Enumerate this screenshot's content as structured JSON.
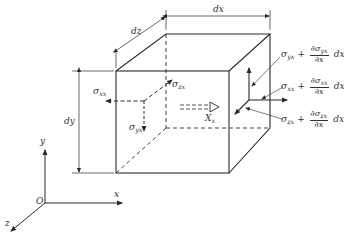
{
  "diagram": {
    "dimensions": {
      "dx": "dx",
      "dy": "dy",
      "dz": "dz"
    },
    "axes": {
      "origin": "O",
      "x": "x",
      "y": "y",
      "z": "z"
    },
    "left_face_stresses": {
      "sxx": "σ",
      "sxx_sub": "xx",
      "szx": "σ",
      "szx_sub": "zx",
      "syx": "σ",
      "syx_sub": "yx"
    },
    "body_force": {
      "label": "X",
      "sub": "x"
    },
    "right_face_stresses": [
      {
        "base": "σ",
        "base_sub": "yx",
        "plus": "+",
        "num": "∂σ",
        "num_sub": "yx",
        "den": "∂x",
        "tail": "dx"
      },
      {
        "base": "σ",
        "base_sub": "xx",
        "plus": "+",
        "num": "∂σ",
        "num_sub": "xx",
        "den": "∂x",
        "tail": "dx"
      },
      {
        "base": "σ",
        "base_sub": "zx",
        "plus": "+",
        "num": "∂σ",
        "num_sub": "zx",
        "den": "∂x",
        "tail": "dx"
      }
    ],
    "colors": {
      "line": "#2a2a2a",
      "text": "#333333",
      "background": "#ffffff"
    }
  }
}
